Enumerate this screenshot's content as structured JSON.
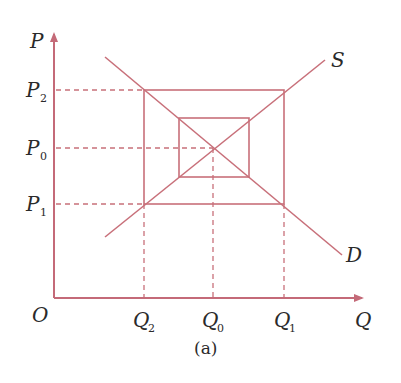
{
  "figure": {
    "caption": "(a)",
    "line_color": "#c8707a",
    "axis_color": "#c46a78",
    "text_color": "#2a2a2a"
  },
  "axes": {
    "y_label": "P",
    "x_label": "Q",
    "origin_label": "O"
  },
  "curves": {
    "supply_label": "S",
    "demand_label": "D"
  },
  "price_ticks": [
    {
      "base": "P",
      "sub": "2"
    },
    {
      "base": "P",
      "sub": "0"
    },
    {
      "base": "P",
      "sub": "1"
    }
  ],
  "quantity_ticks": [
    {
      "base": "Q",
      "sub": "2"
    },
    {
      "base": "Q",
      "sub": "0"
    },
    {
      "base": "Q",
      "sub": "1"
    }
  ]
}
